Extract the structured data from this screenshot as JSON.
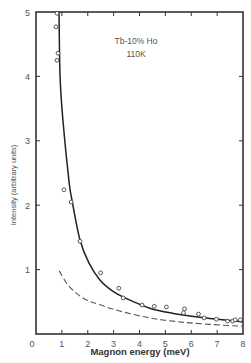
{
  "chart_data": {
    "type": "scatter",
    "title": "",
    "xlabel": "Magnon energy (meV)",
    "ylabel": "Intensity (arbitrary units)",
    "xlim": [
      0,
      8
    ],
    "ylim": [
      0,
      5
    ],
    "xticks": [
      0,
      1,
      2,
      3,
      4,
      5,
      6,
      7,
      8
    ],
    "yticks": [
      1,
      2,
      3,
      4,
      5
    ],
    "grid": false,
    "legend": null,
    "annotations": [
      "Tb-10% Ho",
      "110K"
    ],
    "series": [
      {
        "name": "measured",
        "kind": "scatter",
        "marker": "open-circle",
        "points": [
          [
            0.81,
            4.98
          ],
          [
            0.77,
            4.77
          ],
          [
            0.85,
            4.36
          ],
          [
            0.81,
            4.25
          ],
          [
            1.08,
            2.24
          ],
          [
            1.36,
            2.05
          ],
          [
            1.7,
            1.44
          ],
          [
            2.5,
            0.95
          ],
          [
            3.2,
            0.71
          ],
          [
            3.37,
            0.56
          ],
          [
            4.1,
            0.45
          ],
          [
            4.57,
            0.43
          ],
          [
            5.04,
            0.42
          ],
          [
            5.7,
            0.33
          ],
          [
            5.74,
            0.39
          ],
          [
            6.28,
            0.31
          ],
          [
            6.5,
            0.25
          ],
          [
            6.97,
            0.23
          ],
          [
            7.4,
            0.2
          ],
          [
            7.6,
            0.2
          ],
          [
            7.7,
            0.22
          ],
          [
            7.9,
            0.22
          ]
        ]
      },
      {
        "name": "fit (solid)",
        "kind": "line",
        "style": "solid",
        "points": [
          [
            0.89,
            5.0
          ],
          [
            0.93,
            4.0
          ],
          [
            1.04,
            3.32
          ],
          [
            1.27,
            2.39
          ],
          [
            1.39,
            2.08
          ],
          [
            1.7,
            1.46
          ],
          [
            2.05,
            1.1
          ],
          [
            2.47,
            0.84
          ],
          [
            2.95,
            0.67
          ],
          [
            3.44,
            0.56
          ],
          [
            4.4,
            0.4
          ],
          [
            5.3,
            0.32
          ],
          [
            6.33,
            0.26
          ],
          [
            7.2,
            0.22
          ],
          [
            8.0,
            0.19
          ]
        ]
      },
      {
        "name": "fit (dashed)",
        "kind": "line",
        "style": "dashed",
        "points": [
          [
            0.9,
            0.98
          ],
          [
            1.2,
            0.78
          ],
          [
            1.6,
            0.62
          ],
          [
            2.0,
            0.52
          ],
          [
            2.5,
            0.45
          ],
          [
            3.2,
            0.36
          ],
          [
            4.4,
            0.25
          ],
          [
            5.5,
            0.19
          ],
          [
            6.7,
            0.15
          ],
          [
            8.0,
            0.12
          ]
        ]
      }
    ]
  }
}
